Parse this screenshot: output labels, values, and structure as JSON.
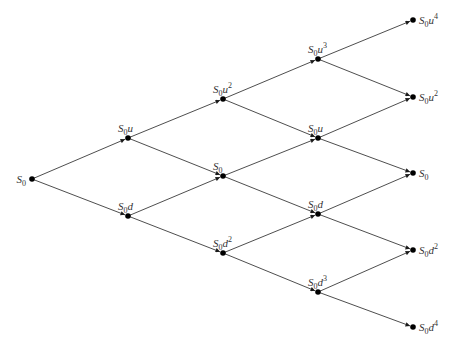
{
  "diagram": {
    "type": "binomial-tree",
    "steps": 4,
    "nodes": [
      {
        "id": "n00",
        "x": 32,
        "y": 179,
        "base": "S",
        "sub": "0",
        "factor": "",
        "exp": "",
        "label_pos": "left"
      },
      {
        "id": "n10",
        "x": 128,
        "y": 138,
        "base": "S",
        "sub": "0",
        "factor": "u",
        "exp": "",
        "label_pos": "above"
      },
      {
        "id": "n11",
        "x": 128,
        "y": 216,
        "base": "S",
        "sub": "0",
        "factor": "d",
        "exp": "",
        "label_pos": "above"
      },
      {
        "id": "n20",
        "x": 223,
        "y": 99,
        "base": "S",
        "sub": "0",
        "factor": "u",
        "exp": "2",
        "label_pos": "above"
      },
      {
        "id": "n21",
        "x": 223,
        "y": 176,
        "base": "S",
        "sub": "0",
        "factor": "",
        "exp": "",
        "label_pos": "above"
      },
      {
        "id": "n22",
        "x": 223,
        "y": 253,
        "base": "S",
        "sub": "0",
        "factor": "d",
        "exp": "2",
        "label_pos": "above"
      },
      {
        "id": "n30",
        "x": 318,
        "y": 59,
        "base": "S",
        "sub": "0",
        "factor": "u",
        "exp": "3",
        "label_pos": "above"
      },
      {
        "id": "n31",
        "x": 318,
        "y": 138,
        "base": "S",
        "sub": "0",
        "factor": "u",
        "exp": "",
        "label_pos": "above"
      },
      {
        "id": "n32",
        "x": 318,
        "y": 214,
        "base": "S",
        "sub": "0",
        "factor": "d",
        "exp": "",
        "label_pos": "above"
      },
      {
        "id": "n33",
        "x": 318,
        "y": 292,
        "base": "S",
        "sub": "0",
        "factor": "d",
        "exp": "3",
        "label_pos": "above"
      },
      {
        "id": "n40",
        "x": 413,
        "y": 20,
        "base": "S",
        "sub": "0",
        "factor": "u",
        "exp": "4",
        "label_pos": "right"
      },
      {
        "id": "n41",
        "x": 413,
        "y": 97,
        "base": "S",
        "sub": "0",
        "factor": "u",
        "exp": "2",
        "label_pos": "right"
      },
      {
        "id": "n42",
        "x": 413,
        "y": 173,
        "base": "S",
        "sub": "0",
        "factor": "",
        "exp": "",
        "label_pos": "right"
      },
      {
        "id": "n43",
        "x": 413,
        "y": 250,
        "base": "S",
        "sub": "0",
        "factor": "d",
        "exp": "2",
        "label_pos": "right"
      },
      {
        "id": "n44",
        "x": 413,
        "y": 327,
        "base": "S",
        "sub": "0",
        "factor": "d",
        "exp": "4",
        "label_pos": "right"
      }
    ],
    "edges": [
      [
        "n00",
        "n10"
      ],
      [
        "n00",
        "n11"
      ],
      [
        "n10",
        "n20"
      ],
      [
        "n10",
        "n21"
      ],
      [
        "n11",
        "n21"
      ],
      [
        "n11",
        "n22"
      ],
      [
        "n20",
        "n30"
      ],
      [
        "n20",
        "n31"
      ],
      [
        "n21",
        "n31"
      ],
      [
        "n21",
        "n32"
      ],
      [
        "n22",
        "n32"
      ],
      [
        "n22",
        "n33"
      ],
      [
        "n30",
        "n40"
      ],
      [
        "n30",
        "n41"
      ],
      [
        "n31",
        "n41"
      ],
      [
        "n31",
        "n42"
      ],
      [
        "n32",
        "n42"
      ],
      [
        "n32",
        "n43"
      ],
      [
        "n33",
        "n43"
      ],
      [
        "n33",
        "n44"
      ]
    ],
    "colors": {
      "edge": "#3a3a3a",
      "node": "#000000",
      "label": "#333333",
      "background": "#ffffff"
    }
  }
}
